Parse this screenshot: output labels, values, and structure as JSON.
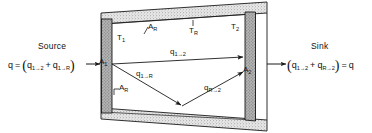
{
  "figure": {
    "colors": {
      "line": "#1a1a1a",
      "wall_fill": "#d9d9d9",
      "endcap_fill": "#9e9e9e",
      "background": "#ffffff"
    },
    "source": {
      "caption": "Source",
      "equation": {
        "lhs": "q",
        "equals": "=",
        "open_paren": "(",
        "term1": {
          "base": "q",
          "sub_from": "1",
          "arrow": "→",
          "sub_to": "2"
        },
        "plus": "+",
        "term2": {
          "base": "q",
          "sub_from": "1",
          "arrow": "→",
          "sub_to": "R"
        },
        "close_paren": ")"
      },
      "arrow_icon": "arrow-right-icon"
    },
    "sink": {
      "caption": "Sink",
      "equation": {
        "open_paren": "(",
        "term1": {
          "base": "q",
          "sub_from": "1",
          "arrow": "→",
          "sub_to": "2"
        },
        "plus": "+",
        "term2": {
          "base": "q",
          "sub_from": "R",
          "arrow": "→",
          "sub_to": "2"
        },
        "close_paren": ")",
        "equals": "=",
        "rhs": "q"
      },
      "arrow_icon": "arrow-right-icon"
    },
    "labels": [
      {
        "name": "area-1",
        "base": "A",
        "sub": "1",
        "x": 99,
        "y": 62
      },
      {
        "name": "temperature-1",
        "base": "T",
        "sub": "1",
        "x": 117,
        "y": 38
      },
      {
        "name": "area-r-top",
        "base": "A",
        "sub": "R",
        "x": 146,
        "y": 28
      },
      {
        "name": "temperature-r",
        "base": "T",
        "sub": "R",
        "x": 191,
        "y": 22
      },
      {
        "name": "temperature-2",
        "base": "T",
        "sub": "2",
        "x": 231,
        "y": 26
      },
      {
        "name": "area-2",
        "base": "A",
        "sub": "2",
        "x": 243,
        "y": 68
      },
      {
        "name": "area-r-bottom",
        "base": "A",
        "sub": "R",
        "x": 117,
        "y": 88
      }
    ],
    "flux_labels": [
      {
        "name": "flux-1-to-2",
        "base": "q",
        "sub_from": "1",
        "arrow": "→",
        "sub_to": "2",
        "x": 175,
        "y": 60
      },
      {
        "name": "flux-1-to-r",
        "base": "q",
        "sub_from": "1",
        "arrow": "→",
        "sub_to": "R",
        "x": 141,
        "y": 72
      },
      {
        "name": "flux-r-to-2",
        "base": "q",
        "sub_from": "R",
        "arrow": "→",
        "sub_to": "2",
        "x": 210,
        "y": 85
      }
    ],
    "geometry": {
      "top_wall_outer": "M101,14 L266,3 L266,13 L101,24 Z",
      "bottom_wall_outer": "M101,108 L266,121 L266,131 L101,118 Z",
      "left_endcap": "M101,18 L112,18 L112,114 L101,114 Z",
      "right_endcap": "M255,9 L266,9 L266,126 L255,126 Z",
      "ray_1_to_2": "M112,64 L254,56",
      "ray_1_to_r": "M112,64 L183,104",
      "ray_r_to_2": "M183,104 L254,72",
      "inner_top": "M112,24 L255,13",
      "inner_bottom": "M112,108 L255,119"
    }
  }
}
